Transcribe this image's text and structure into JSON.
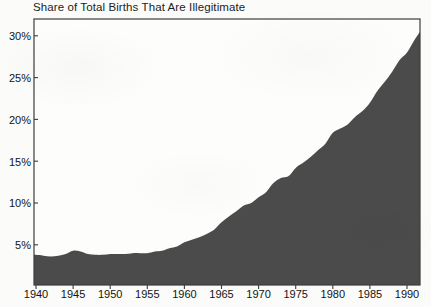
{
  "chart_data": {
    "type": "area",
    "title": "Share of Total Births That Are Illegitimate",
    "xlabel": "",
    "ylabel": "",
    "xlim": [
      1940,
      1992
    ],
    "ylim": [
      0,
      32
    ],
    "grid": false,
    "legend": "none",
    "fill_color": "#4b4b4b",
    "axis_color": "#3c3c3c",
    "background_color": "#fbfbfa",
    "y_tick_labels": [
      "5%",
      "10%",
      "15%",
      "20%",
      "25%",
      "30%"
    ],
    "y_ticks": [
      5,
      10,
      15,
      20,
      25,
      30
    ],
    "x_tick_labels": [
      "1940",
      "1945",
      "1950",
      "1955",
      "1960",
      "1965",
      "1970",
      "1975",
      "1980",
      "1985",
      "1990"
    ],
    "x_ticks": [
      1940,
      1945,
      1950,
      1955,
      1960,
      1965,
      1970,
      1975,
      1980,
      1985,
      1990
    ],
    "x": [
      1940,
      1941,
      1942,
      1943,
      1944,
      1945,
      1946,
      1947,
      1948,
      1949,
      1950,
      1951,
      1952,
      1953,
      1954,
      1955,
      1956,
      1957,
      1958,
      1959,
      1960,
      1961,
      1962,
      1963,
      1964,
      1965,
      1966,
      1967,
      1968,
      1969,
      1970,
      1971,
      1972,
      1973,
      1974,
      1975,
      1976,
      1977,
      1978,
      1979,
      1980,
      1981,
      1982,
      1983,
      1984,
      1985,
      1986,
      1987,
      1988,
      1989,
      1990,
      1991,
      1992
    ],
    "values": [
      3.8,
      3.7,
      3.6,
      3.7,
      3.9,
      4.3,
      4.2,
      3.9,
      3.8,
      3.8,
      3.9,
      3.9,
      3.9,
      4.0,
      4.0,
      4.0,
      4.2,
      4.3,
      4.6,
      4.8,
      5.3,
      5.6,
      5.9,
      6.3,
      6.8,
      7.7,
      8.4,
      9.0,
      9.7,
      10.0,
      10.7,
      11.3,
      12.4,
      13.0,
      13.2,
      14.2,
      14.8,
      15.5,
      16.3,
      17.1,
      18.4,
      18.9,
      19.4,
      20.3,
      21.0,
      22.0,
      23.4,
      24.5,
      25.7,
      27.1,
      28.0,
      29.5,
      30.8
    ],
    "annotations": []
  }
}
